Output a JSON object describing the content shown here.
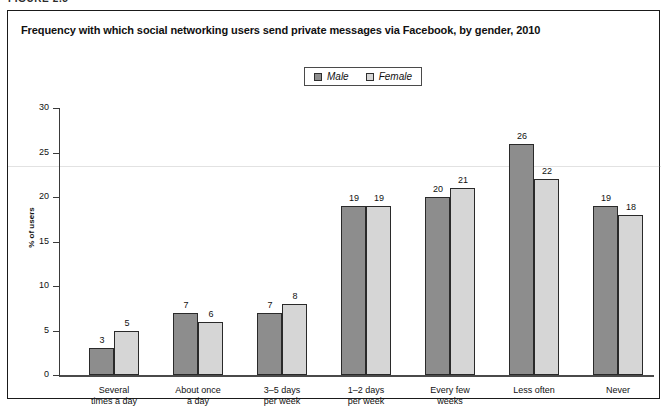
{
  "figure_label": "FIGURE 2.5",
  "chart_title": "Frequency with which social networking users send private messages via Facebook, by gender, 2010",
  "legend": {
    "position": "top-center",
    "entries": [
      {
        "label": "Male",
        "color": "#8d8d8d",
        "icon": "square-swatch-icon"
      },
      {
        "label": "Female",
        "color": "#d6d6d6",
        "icon": "square-swatch-icon"
      }
    ]
  },
  "chart_data": {
    "type": "bar",
    "title": "Frequency with which social networking users send private messages via Facebook, by gender, 2010",
    "xlabel": "",
    "ylabel": "% of users",
    "ylim": [
      0,
      30
    ],
    "ytick_step": 5,
    "yticks": [
      0,
      5,
      10,
      15,
      20,
      25,
      30
    ],
    "ytick_labels": [
      "0",
      "5",
      "10",
      "15",
      "20",
      "25",
      "30"
    ],
    "grid": false,
    "legend_position": "top-center",
    "categories": [
      "Several\ntimes a day",
      "About once\na day",
      "3–5 days\nper week",
      "1–2 days\nper week",
      "Every few\nweeks",
      "Less often",
      "Never"
    ],
    "category_lines": [
      [
        "Several",
        "times a day"
      ],
      [
        "About once",
        "a day"
      ],
      [
        "3–5 days",
        "per week"
      ],
      [
        "1–2 days",
        "per week"
      ],
      [
        "Every few",
        "weeks"
      ],
      [
        "Less often",
        ""
      ],
      [
        "Never",
        ""
      ]
    ],
    "series": [
      {
        "name": "Male",
        "color": "#8d8d8d",
        "values": [
          3,
          7,
          7,
          19,
          20,
          26,
          19
        ]
      },
      {
        "name": "Female",
        "color": "#d6d6d6",
        "values": [
          5,
          6,
          8,
          19,
          21,
          22,
          18
        ]
      }
    ]
  }
}
